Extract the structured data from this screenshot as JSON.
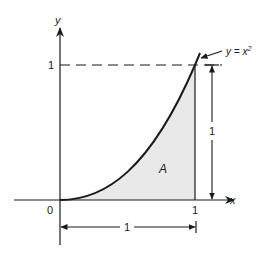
{
  "diagram": {
    "curve_label": "y = x",
    "curve_label_exp": "2",
    "axes": {
      "x_label": "x",
      "y_label": "y",
      "origin_label": "0",
      "x_tick_label": "1",
      "y_tick_label": "1"
    },
    "region_label": "A",
    "dimensions": {
      "horizontal_label": "1",
      "vertical_label": "1"
    },
    "colors": {
      "stroke": "#1a1a1a",
      "shade": "#e9e9e9",
      "background": "#ffffff"
    }
  }
}
